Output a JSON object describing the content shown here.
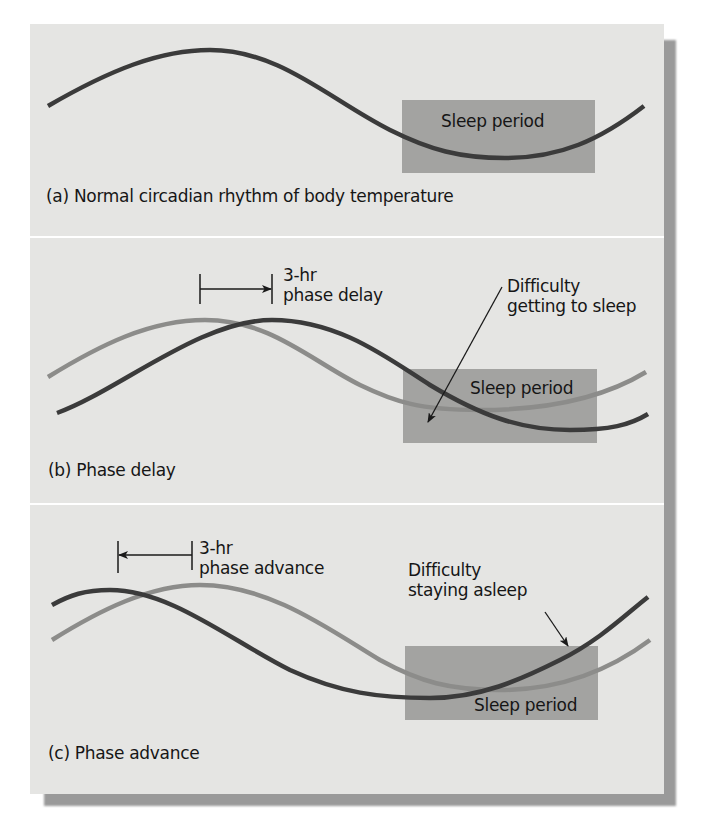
{
  "figure": {
    "colors": {
      "panel_background": "#e5e5e3",
      "sleep_box": "#a3a3a1",
      "normal_curve": "#3b3b3b",
      "reference_curve": "#8c8c8a",
      "text": "#161616"
    },
    "panels": [
      {
        "id": "a",
        "caption": "(a) Normal circadian rhythm of body temperature",
        "sleep_label": "Sleep period",
        "curves": [
          {
            "name": "body temperature",
            "style": "dark"
          }
        ]
      },
      {
        "id": "b",
        "caption": "(b) Phase delay",
        "sleep_label": "Sleep period",
        "shift_label_line1": "3-hr",
        "shift_label_line2": "phase delay",
        "shift_direction": "right",
        "callout_line1": "Difficulty",
        "callout_line2": "getting to sleep",
        "curves": [
          {
            "name": "normal rhythm",
            "style": "light"
          },
          {
            "name": "delayed rhythm",
            "style": "dark"
          }
        ]
      },
      {
        "id": "c",
        "caption": "(c) Phase advance",
        "sleep_label": "Sleep period",
        "shift_label_line1": "3-hr",
        "shift_label_line2": "phase advance",
        "shift_direction": "left",
        "callout_line1": "Difficulty",
        "callout_line2": "staying asleep",
        "curves": [
          {
            "name": "normal rhythm",
            "style": "light"
          },
          {
            "name": "advanced rhythm",
            "style": "dark"
          }
        ]
      }
    ]
  }
}
